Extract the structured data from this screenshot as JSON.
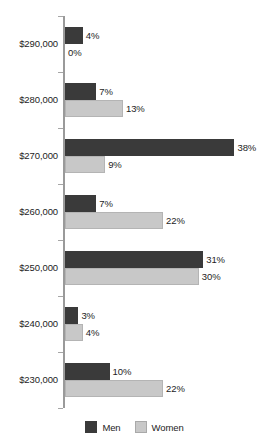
{
  "chart_data": {
    "type": "bar",
    "orientation": "horizontal",
    "grouped": true,
    "title": "",
    "subtitle": "",
    "xlabel": "",
    "ylabel": "",
    "categories": [
      "$290,000",
      "$280,000",
      "$270,000",
      "$260,000",
      "$250,000",
      "$240,000",
      "$230,000"
    ],
    "series": [
      {
        "name": "Men",
        "color": "#3a3a3a",
        "values": [
          4,
          7,
          38,
          7,
          31,
          3,
          10
        ],
        "value_labels": [
          "4%",
          "7%",
          "38%",
          "7%",
          "31%",
          "3%",
          "10%"
        ]
      },
      {
        "name": "Women",
        "color": "#c8c8c8",
        "values": [
          0,
          13,
          9,
          22,
          30,
          4,
          22
        ],
        "value_labels": [
          "0%",
          "13%",
          "9%",
          "22%",
          "30%",
          "4%",
          "22%"
        ]
      }
    ],
    "xlim": [
      0,
      40
    ],
    "value_suffix": "%",
    "grid": false,
    "legend_position": "bottom-center",
    "legend_entries": [
      "Men",
      "Women"
    ]
  },
  "axis": {
    "tick_labels": [
      "$290,000",
      "$280,000",
      "$270,000",
      "$260,000",
      "$250,000",
      "$240,000",
      "$230,000"
    ]
  },
  "legend": {
    "items": [
      {
        "label": "Men",
        "swatch": "men-swatch"
      },
      {
        "label": "Women",
        "swatch": "women-swatch"
      }
    ]
  },
  "colors": {
    "men": "#3a3a3a",
    "women": "#c8c8c8",
    "axis": "#9a9a9a",
    "text": "#1d1d1d",
    "background": "#ffffff"
  }
}
